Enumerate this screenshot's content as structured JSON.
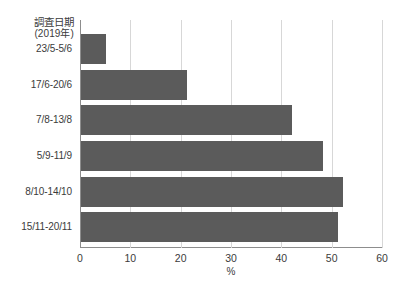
{
  "chart_data": {
    "type": "bar",
    "orientation": "horizontal",
    "title": "",
    "xlabel": "%",
    "ylabel_header": "調査日期",
    "ylabel_header_sub": "(2019年)",
    "categories": [
      "23/5-5/6",
      "17/6-20/6",
      "7/8-13/8",
      "5/9-11/9",
      "8/10-14/10",
      "15/11-20/11"
    ],
    "values": [
      5,
      21,
      42,
      48,
      52,
      51
    ],
    "xlim": [
      0,
      60
    ],
    "xticks": [
      0,
      10,
      20,
      30,
      40,
      50,
      60
    ],
    "xtick_labels": [
      "0",
      "10",
      "20",
      "30",
      "40",
      "50",
      "60"
    ],
    "grid": "vertical",
    "legend": "none",
    "bar_color": "#5b5b5b",
    "gridline_color": "#d7d7d7",
    "axis_color": "#8d8d8d"
  }
}
